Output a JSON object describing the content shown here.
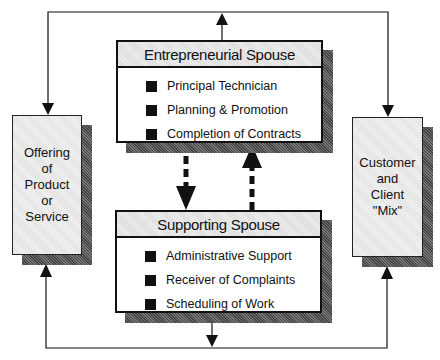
{
  "diagram": {
    "entrepreneurial": {
      "title": "Entrepreneurial Spouse",
      "items": [
        "Principal Technician",
        "Planning & Promotion",
        "Completion of Contracts"
      ]
    },
    "supporting": {
      "title": "Supporting Spouse",
      "items": [
        "Administrative Support",
        "Receiver of Complaints",
        "Scheduling of Work"
      ]
    },
    "left": {
      "lines": [
        "Offering",
        "of",
        "Product",
        "or",
        "Service"
      ]
    },
    "right": {
      "lines": [
        "Customer",
        "and",
        "Client",
        "\"Mix\""
      ]
    },
    "colors": {
      "line": "#111111",
      "shadow": "#555555",
      "header_fill": "#e6e6e6",
      "side_fill": "#ececec"
    }
  }
}
